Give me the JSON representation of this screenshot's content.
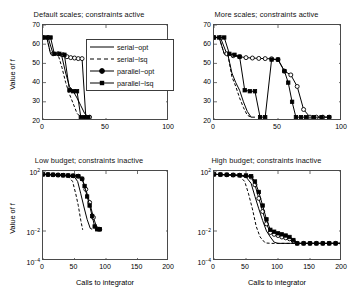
{
  "figure": {
    "legend_entries": [
      {
        "label": "serial−opt",
        "style": "solid",
        "marker": "none"
      },
      {
        "label": "serial−lsq",
        "style": "dashed",
        "marker": "none"
      },
      {
        "label": "parallel−opt",
        "style": "solid",
        "marker": "circle"
      },
      {
        "label": "parallel−lsq",
        "style": "solid",
        "marker": "square"
      }
    ],
    "legend_position": "top-right of first panel"
  },
  "chart_data": [
    {
      "type": "line",
      "panel": "top-left",
      "title": "Default scales; constraints active",
      "xlabel": "",
      "ylabel": "Value of f",
      "xlim": [
        0,
        100
      ],
      "ylim": [
        20,
        70
      ],
      "yscale": "linear",
      "xticks": [
        0,
        50,
        100
      ],
      "xticklabels": [
        "0",
        "50",
        "100"
      ],
      "yticks": [
        20,
        30,
        40,
        50,
        60,
        70
      ],
      "yticklabels": [
        "20",
        "30",
        "40",
        "50",
        "60",
        "70"
      ],
      "grid": false,
      "series": [
        {
          "name": "serial−opt",
          "style": "solid",
          "marker": "none",
          "x": [
            0,
            3,
            6,
            9,
            12,
            15,
            18,
            21,
            24,
            27,
            30,
            33,
            36
          ],
          "y": [
            63.5,
            63.5,
            55,
            55,
            54.5,
            53.5,
            45,
            38,
            35.5,
            32,
            28,
            24,
            22
          ]
        },
        {
          "name": "serial−lsq",
          "style": "dashed",
          "marker": "none",
          "x": [
            0,
            3,
            6,
            9,
            12,
            15,
            18,
            21,
            24,
            27,
            30
          ],
          "y": [
            63.5,
            63.5,
            55,
            55,
            54.5,
            48,
            40,
            34,
            29,
            24,
            22
          ]
        },
        {
          "name": "parallel−opt",
          "style": "solid",
          "marker": "circle",
          "x": [
            0,
            4,
            8,
            12,
            16,
            19,
            22,
            25,
            28,
            31,
            34,
            37
          ],
          "y": [
            63.5,
            63.5,
            55,
            55,
            54.5,
            53.5,
            53,
            52.8,
            52.5,
            52.5,
            22,
            22
          ]
        },
        {
          "name": "parallel−lsq",
          "style": "solid",
          "marker": "square",
          "x": [
            0,
            3,
            6,
            9,
            13,
            17,
            21,
            24,
            27,
            30,
            33,
            36
          ],
          "y": [
            63.5,
            63.5,
            63.5,
            55,
            55,
            54.5,
            36,
            35.5,
            35.5,
            22,
            22,
            22
          ]
        }
      ]
    },
    {
      "type": "line",
      "panel": "top-right",
      "title": "More scales; constraints active",
      "xlabel": "",
      "ylabel": "",
      "xlim": [
        0,
        100
      ],
      "ylim": [
        20,
        70
      ],
      "yscale": "linear",
      "xticks": [
        0,
        50,
        100
      ],
      "xticklabels": [
        "0",
        "50",
        "100"
      ],
      "yticks": [
        20,
        30,
        40,
        50,
        60,
        70
      ],
      "yticklabels": [
        "20",
        "30",
        "40",
        "50",
        "60",
        "70"
      ],
      "grid": false,
      "series": [
        {
          "name": "serial−opt",
          "style": "solid",
          "marker": "none",
          "x": [
            0,
            4,
            8,
            11,
            14,
            17,
            20,
            23,
            26,
            29,
            32
          ],
          "y": [
            63.5,
            63.5,
            55,
            54,
            45,
            40,
            36,
            30,
            25,
            22,
            22
          ]
        },
        {
          "name": "serial−lsq",
          "style": "dashed",
          "marker": "none",
          "x": [
            0,
            4,
            8,
            11,
            14,
            17,
            20,
            23,
            26,
            29
          ],
          "y": [
            63.5,
            63.5,
            55,
            54,
            43,
            38,
            32,
            27,
            23,
            22
          ]
        },
        {
          "name": "parallel−opt",
          "style": "solid",
          "marker": "circle",
          "x": [
            0,
            5,
            10,
            15,
            20,
            25,
            30,
            35,
            40,
            45,
            50,
            55,
            60,
            65,
            70,
            75,
            80,
            85,
            90
          ],
          "y": [
            63.5,
            63.5,
            55,
            54,
            53.5,
            53,
            52.8,
            52.6,
            52.5,
            52.4,
            52,
            46,
            44,
            38,
            26,
            22,
            22,
            22,
            22
          ]
        },
        {
          "name": "parallel−lsq",
          "style": "solid",
          "marker": "square",
          "x": [
            0,
            4,
            8,
            12,
            16,
            20,
            24,
            28,
            32,
            36,
            40,
            45,
            50,
            55,
            58,
            61,
            64,
            68,
            72,
            78,
            84,
            90
          ],
          "y": [
            63.5,
            63.5,
            63.5,
            55,
            54.5,
            53.5,
            36,
            35.5,
            35.5,
            22,
            22,
            52,
            52,
            46,
            40,
            30,
            22,
            22,
            22,
            22,
            22,
            22
          ]
        }
      ]
    },
    {
      "type": "line",
      "panel": "bottom-left",
      "title": "Low budget; constraints inactive",
      "xlabel": "Calls to integrator",
      "ylabel": "Value of f",
      "xlim": [
        0,
        200
      ],
      "ylim": [
        0.0001,
        100
      ],
      "yscale": "log",
      "xticks": [
        0,
        50,
        100,
        150,
        200
      ],
      "xticklabels": [
        "0",
        "50",
        "100",
        "150",
        "200"
      ],
      "yticks": [
        100,
        0.01,
        0.0001
      ],
      "yticklabels": [
        "10",
        "10",
        "10"
      ],
      "ytickexponents": [
        "2",
        "−2",
        "−4"
      ],
      "grid": false,
      "series": [
        {
          "name": "serial−opt",
          "style": "solid",
          "marker": "none",
          "x": [
            0,
            10,
            20,
            30,
            40,
            50,
            55,
            60,
            65,
            70,
            75,
            78
          ],
          "y": [
            60,
            58,
            55,
            52,
            48,
            40,
            20,
            3,
            0.4,
            0.06,
            0.015,
            0.013
          ]
        },
        {
          "name": "serial−lsq",
          "style": "dashed",
          "marker": "none",
          "x": [
            0,
            10,
            20,
            30,
            40,
            47,
            52,
            56,
            60,
            63
          ],
          "y": [
            60,
            58,
            55,
            52,
            45,
            20,
            3,
            0.5,
            0.05,
            0.012
          ]
        },
        {
          "name": "parallel−opt",
          "style": "solid",
          "marker": "circle",
          "x": [
            0,
            8,
            16,
            24,
            32,
            40,
            48,
            56,
            62,
            68,
            74,
            80,
            86,
            90
          ],
          "y": [
            60,
            58,
            56,
            54,
            52,
            50,
            48,
            45,
            30,
            6,
            0.8,
            0.08,
            0.014,
            0.013
          ]
        },
        {
          "name": "parallel−lsq",
          "style": "solid",
          "marker": "square",
          "x": [
            0,
            8,
            16,
            24,
            32,
            40,
            48,
            56,
            62,
            66,
            70,
            74,
            78,
            82,
            86,
            90
          ],
          "y": [
            60,
            58,
            56,
            54,
            52,
            50,
            48,
            45,
            30,
            10,
            2,
            0.5,
            0.1,
            0.02,
            0.013,
            0.013
          ]
        }
      ]
    },
    {
      "type": "line",
      "panel": "bottom-right",
      "title": "High budget; constraints inactive",
      "xlabel": "Calls to integrator",
      "ylabel": "",
      "xlim": [
        0,
        200
      ],
      "ylim": [
        0.0001,
        100
      ],
      "yscale": "log",
      "xticks": [
        0,
        50,
        100,
        150,
        200
      ],
      "xticklabels": [
        "0",
        "50",
        "100",
        "150",
        "200"
      ],
      "yticks": [
        100,
        0.01,
        0.0001
      ],
      "yticklabels": [
        "10",
        "10",
        "10"
      ],
      "ytickexponents": [
        "2",
        "−2",
        "−4"
      ],
      "grid": false,
      "series": [
        {
          "name": "serial−opt",
          "style": "solid",
          "marker": "none",
          "x": [
            0,
            10,
            20,
            30,
            40,
            50,
            58,
            64,
            70,
            76,
            82,
            88,
            94,
            100,
            110,
            120,
            130,
            150,
            170,
            200
          ],
          "y": [
            60,
            58,
            56,
            54,
            50,
            40,
            15,
            2,
            0.3,
            0.05,
            0.01,
            0.004,
            0.0018,
            0.0015,
            0.0015,
            0.0015,
            0.0015,
            0.0015,
            0.0015,
            0.0015
          ]
        },
        {
          "name": "serial−lsq",
          "style": "dashed",
          "marker": "none",
          "x": [
            0,
            10,
            20,
            30,
            40,
            48,
            54,
            60,
            66,
            72,
            80,
            90,
            100,
            120,
            150,
            180,
            200
          ],
          "y": [
            60,
            58,
            56,
            54,
            45,
            20,
            3,
            0.3,
            0.02,
            0.004,
            0.0016,
            0.0015,
            0.0015,
            0.0015,
            0.0015,
            0.0015,
            0.0015
          ]
        },
        {
          "name": "parallel−opt",
          "style": "solid",
          "marker": "circle",
          "x": [
            0,
            10,
            20,
            30,
            40,
            50,
            58,
            64,
            70,
            76,
            82,
            88,
            94,
            100,
            106,
            112,
            118,
            124,
            130,
            140,
            150,
            160,
            170,
            180,
            190,
            200
          ],
          "y": [
            60,
            58,
            56,
            54,
            52,
            48,
            40,
            12,
            1.5,
            0.2,
            0.03,
            0.008,
            0.006,
            0.005,
            0.004,
            0.0035,
            0.003,
            0.0022,
            0.0015,
            0.0015,
            0.0015,
            0.0015,
            0.0015,
            0.0015,
            0.0015,
            0.0015
          ]
        },
        {
          "name": "parallel−lsq",
          "style": "solid",
          "marker": "square",
          "x": [
            0,
            10,
            20,
            30,
            40,
            50,
            58,
            64,
            70,
            76,
            82,
            88,
            94,
            100,
            106,
            112,
            118,
            124,
            130,
            140,
            150,
            160,
            170,
            180,
            190,
            200
          ],
          "y": [
            60,
            58,
            56,
            54,
            52,
            50,
            45,
            20,
            4,
            0.5,
            0.06,
            0.012,
            0.009,
            0.007,
            0.006,
            0.005,
            0.004,
            0.0025,
            0.0015,
            0.0015,
            0.0015,
            0.0015,
            0.0015,
            0.0015,
            0.0015,
            0.0015
          ]
        }
      ]
    }
  ]
}
